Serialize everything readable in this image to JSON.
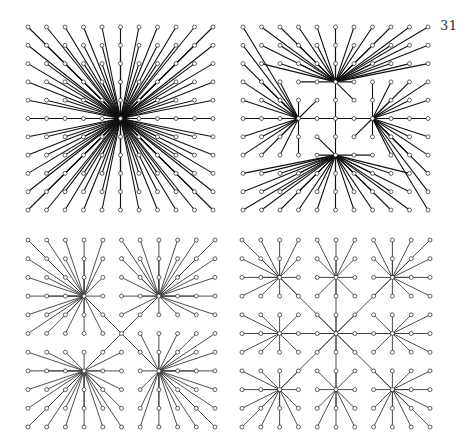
{
  "page": {
    "number": "31"
  },
  "style": {
    "background": "#ffffff",
    "edge_color": "#111111",
    "edge_color_light": "#3a3a3a",
    "node_stroke": "#222222",
    "node_radius": 2
  },
  "panels": [
    {
      "id": "panel-top-left",
      "description": "Star: all 121 grid nodes joined to the center node",
      "grid": {
        "cols": 11,
        "rows": 11,
        "x0": 28,
        "y0": 27,
        "dx": 18.5,
        "dy": 18.3
      },
      "type": "single-hub",
      "hubs": [
        [
          5,
          5
        ]
      ],
      "stroke_width": 1.1,
      "light": false
    },
    {
      "id": "panel-top-right",
      "description": "Pinwheel: four hubs joined by a central tree, each hub serving one rotated sector",
      "grid": {
        "cols": 11,
        "rows": 11,
        "x0": 243,
        "y0": 27,
        "dx": 18.5,
        "dy": 18.3
      },
      "type": "pinwheel",
      "hubs": {
        "top": [
          5,
          3
        ],
        "left": [
          3,
          5
        ],
        "right": [
          7,
          5
        ],
        "bottom": [
          5,
          7
        ]
      },
      "tree_edges": [
        [
          [
            3,
            3
          ],
          [
            4,
            3
          ]
        ],
        [
          [
            4,
            3
          ],
          [
            5,
            3
          ]
        ],
        [
          [
            5,
            3
          ],
          [
            6,
            3
          ]
        ],
        [
          [
            5,
            3
          ],
          [
            6,
            4
          ]
        ],
        [
          [
            5,
            3
          ],
          [
            5,
            4
          ]
        ],
        [
          [
            5,
            4
          ],
          [
            5,
            5
          ]
        ],
        [
          [
            5,
            5
          ],
          [
            5,
            6
          ]
        ],
        [
          [
            5,
            6
          ],
          [
            5,
            7
          ]
        ],
        [
          [
            3,
            5
          ],
          [
            4,
            5
          ]
        ],
        [
          [
            4,
            5
          ],
          [
            5,
            5
          ]
        ],
        [
          [
            5,
            5
          ],
          [
            6,
            5
          ]
        ],
        [
          [
            6,
            5
          ],
          [
            7,
            5
          ]
        ],
        [
          [
            3,
            4
          ],
          [
            3,
            5
          ]
        ],
        [
          [
            3,
            5
          ],
          [
            3,
            6
          ]
        ],
        [
          [
            3,
            6
          ],
          [
            3,
            7
          ]
        ],
        [
          [
            4,
            4
          ],
          [
            3,
            5
          ]
        ],
        [
          [
            7,
            3
          ],
          [
            7,
            4
          ]
        ],
        [
          [
            7,
            4
          ],
          [
            7,
            5
          ]
        ],
        [
          [
            7,
            5
          ],
          [
            7,
            6
          ]
        ],
        [
          [
            7,
            5
          ],
          [
            6,
            6
          ]
        ],
        [
          [
            4,
            7
          ],
          [
            5,
            7
          ]
        ],
        [
          [
            5,
            7
          ],
          [
            6,
            7
          ]
        ],
        [
          [
            6,
            7
          ],
          [
            7,
            7
          ]
        ],
        [
          [
            4,
            6
          ],
          [
            5,
            7
          ]
        ]
      ],
      "stroke_width": 1.1,
      "light": false
    },
    {
      "id": "panel-bottom-left",
      "description": "Four hubs, each serving one quadrant, joined diagonally through the center",
      "grid": {
        "cols": 11,
        "rows": 11,
        "x0": 28,
        "y0": 240,
        "dx": 18.7,
        "dy": 18.7
      },
      "type": "quadrant-hubs",
      "hubs": [
        [
          3,
          3
        ],
        [
          7,
          3
        ],
        [
          3,
          7
        ],
        [
          7,
          7
        ]
      ],
      "center": [
        5,
        5
      ],
      "stroke_width": 0.9,
      "light": true
    },
    {
      "id": "panel-bottom-right",
      "description": "Nine hubs on a 3x3 lattice, outer hubs linked to the central hub",
      "grid": {
        "cols": 11,
        "rows": 11,
        "x0": 242,
        "y0": 240,
        "dx": 18.8,
        "dy": 18.7
      },
      "type": "nine-hubs",
      "hubs": [
        [
          2,
          2
        ],
        [
          5,
          2
        ],
        [
          8,
          2
        ],
        [
          2,
          5
        ],
        [
          5,
          5
        ],
        [
          8,
          5
        ],
        [
          2,
          8
        ],
        [
          5,
          8
        ],
        [
          8,
          8
        ]
      ],
      "center": [
        5,
        5
      ],
      "stroke_width": 0.9,
      "light": true
    }
  ]
}
